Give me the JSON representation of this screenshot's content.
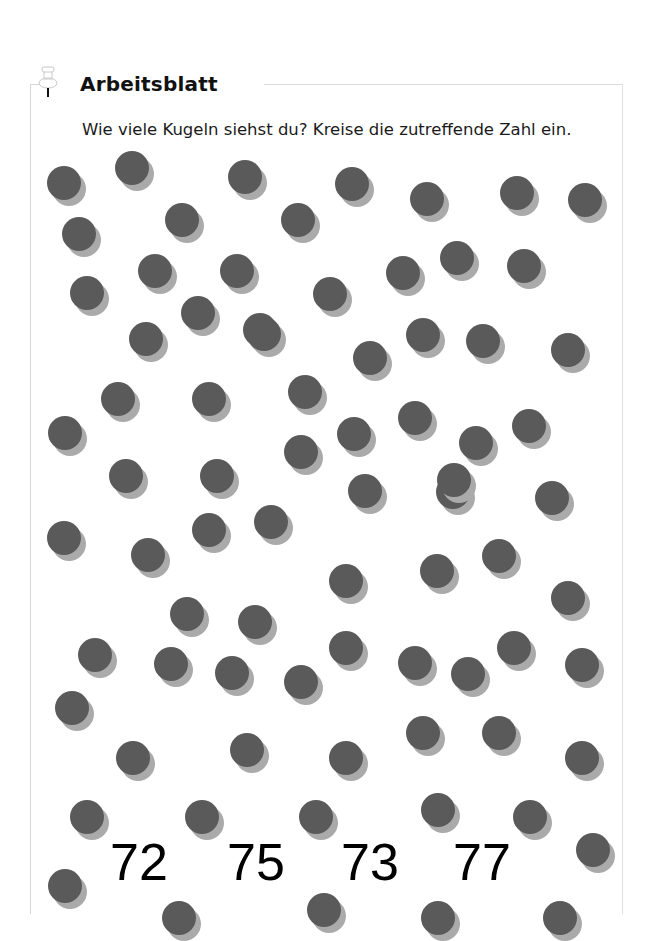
{
  "header": {
    "title": "Arbeitsblatt",
    "icon": "pushpin-icon"
  },
  "task": {
    "instruction": "Wie viele Kugeln siehst du? Kreise die zutreffende Zahl ein."
  },
  "colors": {
    "ball": "#5a5a5a",
    "ball_shadow": "#aaaaaa",
    "frame": "#d6d6d6",
    "text": "#111111"
  },
  "balls": [
    [
      64,
      183
    ],
    [
      132,
      168
    ],
    [
      245,
      177
    ],
    [
      352,
      184
    ],
    [
      427,
      199
    ],
    [
      517,
      193
    ],
    [
      585,
      200
    ],
    [
      79,
      234
    ],
    [
      182,
      220
    ],
    [
      298,
      220
    ],
    [
      155,
      271
    ],
    [
      237,
      271
    ],
    [
      403,
      273
    ],
    [
      457,
      258
    ],
    [
      524,
      266
    ],
    [
      87,
      293
    ],
    [
      330,
      294
    ],
    [
      198,
      313
    ],
    [
      260,
      330
    ],
    [
      146,
      339
    ],
    [
      264,
      334
    ],
    [
      370,
      358
    ],
    [
      423,
      335
    ],
    [
      483,
      341
    ],
    [
      568,
      350
    ],
    [
      118,
      399
    ],
    [
      209,
      399
    ],
    [
      305,
      392
    ],
    [
      65,
      433
    ],
    [
      354,
      434
    ],
    [
      415,
      418
    ],
    [
      476,
      443
    ],
    [
      529,
      426
    ],
    [
      301,
      452
    ],
    [
      126,
      476
    ],
    [
      217,
      476
    ],
    [
      453,
      492
    ],
    [
      365,
      491
    ],
    [
      454,
      480
    ],
    [
      552,
      498
    ],
    [
      64,
      538
    ],
    [
      148,
      555
    ],
    [
      209,
      530
    ],
    [
      271,
      522
    ],
    [
      346,
      581
    ],
    [
      437,
      571
    ],
    [
      499,
      556
    ],
    [
      568,
      598
    ],
    [
      187,
      614
    ],
    [
      255,
      622
    ],
    [
      95,
      655
    ],
    [
      346,
      648
    ],
    [
      415,
      663
    ],
    [
      514,
      648
    ],
    [
      171,
      664
    ],
    [
      232,
      673
    ],
    [
      301,
      682
    ],
    [
      468,
      674
    ],
    [
      582,
      665
    ],
    [
      72,
      708
    ],
    [
      133,
      758
    ],
    [
      247,
      750
    ],
    [
      346,
      758
    ],
    [
      423,
      733
    ],
    [
      499,
      733
    ],
    [
      582,
      758
    ],
    [
      87,
      817
    ],
    [
      202,
      817
    ],
    [
      316,
      817
    ],
    [
      438,
      810
    ],
    [
      530,
      817
    ],
    [
      65,
      886
    ],
    [
      593,
      850
    ],
    [
      179,
      918
    ],
    [
      324,
      910
    ],
    [
      438,
      918
    ],
    [
      560,
      918
    ]
  ],
  "answers": [
    {
      "label": "72",
      "x": 139,
      "y": 862
    },
    {
      "label": "75",
      "x": 256,
      "y": 862
    },
    {
      "label": "73",
      "x": 370,
      "y": 862
    },
    {
      "label": "77",
      "x": 482,
      "y": 862
    }
  ]
}
